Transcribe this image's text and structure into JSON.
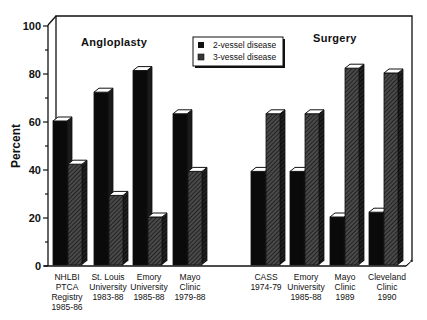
{
  "chart_data": {
    "type": "bar",
    "style": "3d-grouped",
    "title": "",
    "xlabel": "",
    "ylabel": "Percent",
    "ylim": [
      0,
      100
    ],
    "yticks": [
      0,
      20,
      40,
      60,
      80,
      100
    ],
    "grid": false,
    "legend_position": "upper-center",
    "group_titles": [
      "Angloplasty",
      "Surgery"
    ],
    "categories": [
      "NHLBI PTCA Registry 1985-86",
      "St. Louis University 1983-88",
      "Emory University 1985-88",
      "Mayo Clinic 1979-88",
      "CASS 1974-79",
      "Emory University 1985-88",
      "Mayo Clinic 1989",
      "Cleveland Clinic 1990"
    ],
    "category_lines": [
      [
        "NHLBI",
        "PTCA",
        "Registry",
        "1985-86"
      ],
      [
        "St. Louis",
        "University",
        "1983-88"
      ],
      [
        "Emory",
        "University",
        "1985-88"
      ],
      [
        "Mayo",
        "Clinic",
        "1979-88"
      ],
      [
        "CASS",
        "1974-79"
      ],
      [
        "Emory",
        "University",
        "1985-88"
      ],
      [
        "Mayo",
        "Clinic",
        "1989"
      ],
      [
        "Cleveland",
        "Clinic",
        "1990"
      ]
    ],
    "category_group": [
      "Angloplasty",
      "Angloplasty",
      "Angloplasty",
      "Angloplasty",
      "Surgery",
      "Surgery",
      "Surgery",
      "Surgery"
    ],
    "series": [
      {
        "name": "2-vessel disease",
        "fill": "solid-black",
        "values": [
          60,
          72,
          81,
          63,
          39,
          39,
          20,
          22
        ]
      },
      {
        "name": "3-vessel disease",
        "fill": "diagonal-hatch",
        "values": [
          42,
          29,
          20,
          39,
          63,
          63,
          82,
          80
        ]
      }
    ]
  },
  "colors": {
    "ink": "#111111",
    "background": "#ffffff",
    "hatch_fill": "#3a3a3a",
    "bar_cap": "#ffffff"
  }
}
